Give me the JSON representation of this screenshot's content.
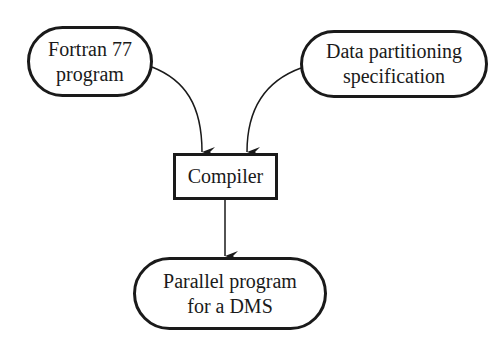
{
  "diagram": {
    "type": "flowchart",
    "nodes": {
      "fortran": {
        "line1": "Fortran 77",
        "line2": "program",
        "shape": "rounded"
      },
      "partition": {
        "line1": "Data partitioning",
        "line2": "specification",
        "shape": "rounded"
      },
      "compiler": {
        "label": "Compiler",
        "shape": "rectangle"
      },
      "output": {
        "line1": "Parallel program",
        "line2": "for a DMS",
        "shape": "rounded"
      }
    },
    "edges": [
      {
        "from": "fortran",
        "to": "compiler"
      },
      {
        "from": "partition",
        "to": "compiler"
      },
      {
        "from": "compiler",
        "to": "output"
      }
    ],
    "colors": {
      "stroke": "#1a1a1a",
      "background": "#ffffff"
    }
  }
}
